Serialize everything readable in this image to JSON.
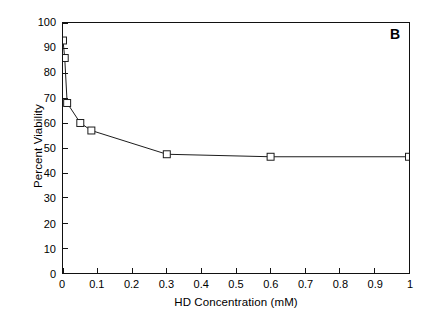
{
  "figure": {
    "panel_label": "B",
    "background_color": "#ffffff",
    "line_color": "#1a1a1a",
    "marker_edge_color": "#1a1a1a",
    "marker_face_color": "#ffffff",
    "axis_color": "#111111"
  },
  "chart_data": {
    "type": "line",
    "title": "",
    "xlabel": "HD Concentration (mM)",
    "ylabel": "Percent Viability",
    "xlim": [
      0,
      1
    ],
    "ylim": [
      0,
      100
    ],
    "xticks": [
      0,
      0.1,
      0.2,
      0.3,
      0.4,
      0.5,
      0.6,
      0.7,
      0.8,
      0.9,
      1
    ],
    "xtick_labels": [
      "0",
      "0.1",
      "0.2",
      "0.3",
      "0.4",
      "0.5",
      "0.6",
      "0.7",
      "0.8",
      "0.9",
      "1"
    ],
    "yticks": [
      0,
      10,
      20,
      30,
      40,
      50,
      60,
      70,
      80,
      90,
      100
    ],
    "ytick_labels": [
      "0",
      "10",
      "20",
      "30",
      "40",
      "50",
      "60",
      "70",
      "80",
      "90",
      "100"
    ],
    "grid": false,
    "legend": false,
    "marker": "open-square",
    "series": [
      {
        "name": "Percent Viability",
        "x": [
          0,
          0.005,
          0.012,
          0.05,
          0.082,
          0.3,
          0.6,
          1.0
        ],
        "y": [
          93,
          86,
          68,
          60,
          57,
          47.5,
          46.5,
          46.5
        ]
      }
    ],
    "annotations": [
      {
        "text": "B",
        "position": "top-right"
      }
    ]
  }
}
